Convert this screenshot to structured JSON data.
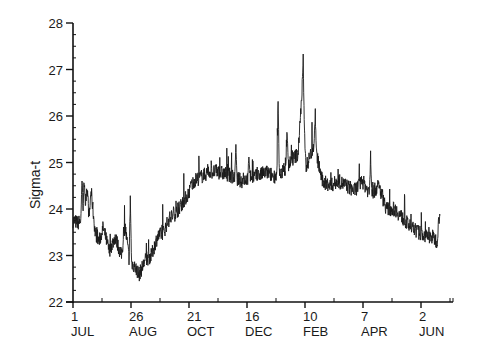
{
  "chart_data": {
    "type": "line",
    "title": "",
    "xlabel": "",
    "ylabel": "Sigma-t",
    "ylim": [
      22,
      28
    ],
    "yticks": [
      22,
      23,
      24,
      25,
      26,
      27,
      28
    ],
    "xticks": [
      {
        "day": "1",
        "month": "JUL"
      },
      {
        "day": "26",
        "month": "AUG"
      },
      {
        "day": "21",
        "month": "OCT"
      },
      {
        "day": "16",
        "month": "DEC"
      },
      {
        "day": "10",
        "month": "FEB"
      },
      {
        "day": "7",
        "month": "APR"
      },
      {
        "day": "2",
        "month": "JUN"
      }
    ],
    "grid": false,
    "legend": null,
    "series": [
      {
        "name": "Sigma-t",
        "x_days": [
          0,
          5,
          10,
          14,
          16,
          18,
          22,
          26,
          30,
          36,
          42,
          48,
          52,
          56,
          60,
          66,
          72,
          78,
          84,
          90,
          96,
          102,
          108,
          114,
          120,
          128,
          136,
          144,
          152,
          160,
          168,
          176,
          184,
          192,
          200,
          208,
          216,
          224,
          228,
          232,
          240,
          248,
          256,
          264,
          272,
          280,
          288,
          296,
          304,
          312,
          320,
          328,
          336,
          344,
          352,
          358,
          362,
          365
        ],
        "values": [
          23.75,
          23.7,
          23.8,
          24.5,
          23.8,
          24.4,
          23.5,
          23.3,
          23.6,
          23.1,
          23.4,
          23.0,
          23.6,
          22.9,
          22.8,
          22.6,
          22.9,
          23.0,
          23.4,
          23.5,
          23.8,
          23.9,
          24.1,
          24.3,
          24.6,
          24.7,
          24.8,
          24.8,
          24.75,
          24.7,
          24.6,
          24.7,
          24.7,
          24.8,
          24.7,
          24.8,
          25.0,
          25.2,
          26.6,
          24.9,
          25.4,
          24.6,
          24.5,
          24.6,
          24.5,
          24.4,
          24.6,
          24.3,
          24.5,
          24.0,
          24.0,
          23.8,
          23.6,
          23.5,
          23.4,
          23.4,
          23.3,
          24.0
        ],
        "spikes": [
          {
            "day": 9,
            "value": 24.8
          },
          {
            "day": 11,
            "value": 24.8
          },
          {
            "day": 57,
            "value": 24.4
          },
          {
            "day": 117,
            "value": 24.6
          },
          {
            "day": 162,
            "value": 25.4
          },
          {
            "day": 175,
            "value": 25.2
          },
          {
            "day": 213,
            "value": 25.8
          },
          {
            "day": 229,
            "value": 27.35
          },
          {
            "day": 241,
            "value": 26.2
          },
          {
            "day": 204,
            "value": 26.5
          },
          {
            "day": 296,
            "value": 25.3
          }
        ]
      }
    ]
  }
}
